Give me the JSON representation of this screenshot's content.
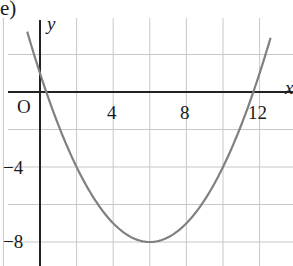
{
  "panel_label": "e)",
  "chart_data": {
    "type": "line",
    "title": "",
    "xlabel": "x",
    "ylabel": "y",
    "origin_label": "O",
    "x_ticks": [
      4,
      8,
      12
    ],
    "y_ticks": [
      -4,
      -8
    ],
    "x_tick_labels": [
      "4",
      "8",
      "12"
    ],
    "y_tick_labels": [
      "−4",
      "−8"
    ],
    "grid": true,
    "grid_step": 2,
    "xlim": [
      -2,
      14
    ],
    "ylim": [
      -9,
      4
    ],
    "series": [
      {
        "name": "parabola",
        "equation": "y = 0.25(x - 6)^2 - 8",
        "vertex": [
          6,
          -8
        ],
        "y_intercept": 1,
        "roots": [
          0.34,
          11.66
        ],
        "x": [
          -0.7,
          0,
          2,
          4,
          6,
          8,
          10,
          12,
          12.6
        ],
        "y": [
          3.22,
          1,
          -4,
          -7,
          -8,
          -7,
          -4,
          1,
          2.89
        ],
        "color": "#808080"
      }
    ]
  }
}
